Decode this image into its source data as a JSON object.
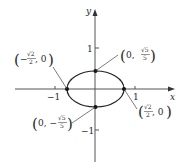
{
  "diagram": {
    "type": "ellipse-on-axes",
    "axes": {
      "x_label": "x",
      "y_label": "y",
      "x_ticks": [
        {
          "value": -1,
          "label": "−1"
        },
        {
          "value": 1,
          "label": "1"
        }
      ],
      "y_ticks": [
        {
          "value": 1,
          "label": "1"
        },
        {
          "value": -1,
          "label": "−1"
        }
      ]
    },
    "ellipse": {
      "center": [
        0,
        0
      ],
      "semi_major_x": "√2/2",
      "semi_minor_y": "√5/5"
    },
    "points": [
      {
        "name": "top-vertex",
        "label_pre": "0,",
        "num": "√5",
        "den": "5",
        "sign": ""
      },
      {
        "name": "bottom-vertex",
        "label_pre": "0, −",
        "num": "√5",
        "den": "5",
        "sign": "−"
      },
      {
        "name": "left-vertex",
        "label_pre": "−",
        "num": "√2",
        "den": "2",
        "post": ", 0"
      },
      {
        "name": "right-vertex",
        "label_pre": "",
        "num": "√2",
        "den": "2",
        "post": ", 0"
      }
    ],
    "colors": {
      "ink": "#2a2a2a",
      "axis": "#555555"
    }
  }
}
